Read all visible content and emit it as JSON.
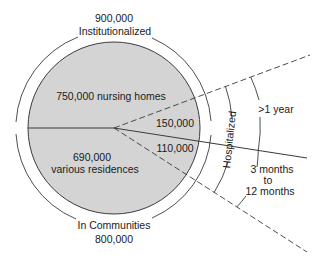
{
  "diagram": {
    "top_label": {
      "count": "900,000",
      "category": "Institutionalized"
    },
    "bottom_label": {
      "category": "In Communities",
      "count": "800,000"
    },
    "segments": {
      "nursing_homes": "750,000 nursing homes",
      "various_count": "690,000",
      "various_label": "various residences",
      "long_stay": "150,000",
      "short_stay": "110,000"
    },
    "hospitalized_label": "Hospitalized",
    "duration_labels": {
      "long": ">1 year",
      "short_line1": "3 months",
      "short_line2": "to",
      "short_line3": "12 months"
    },
    "colors": {
      "fill": "#d4d4d4",
      "stroke": "#3a3a3a",
      "text": "#1a1a1a"
    }
  }
}
